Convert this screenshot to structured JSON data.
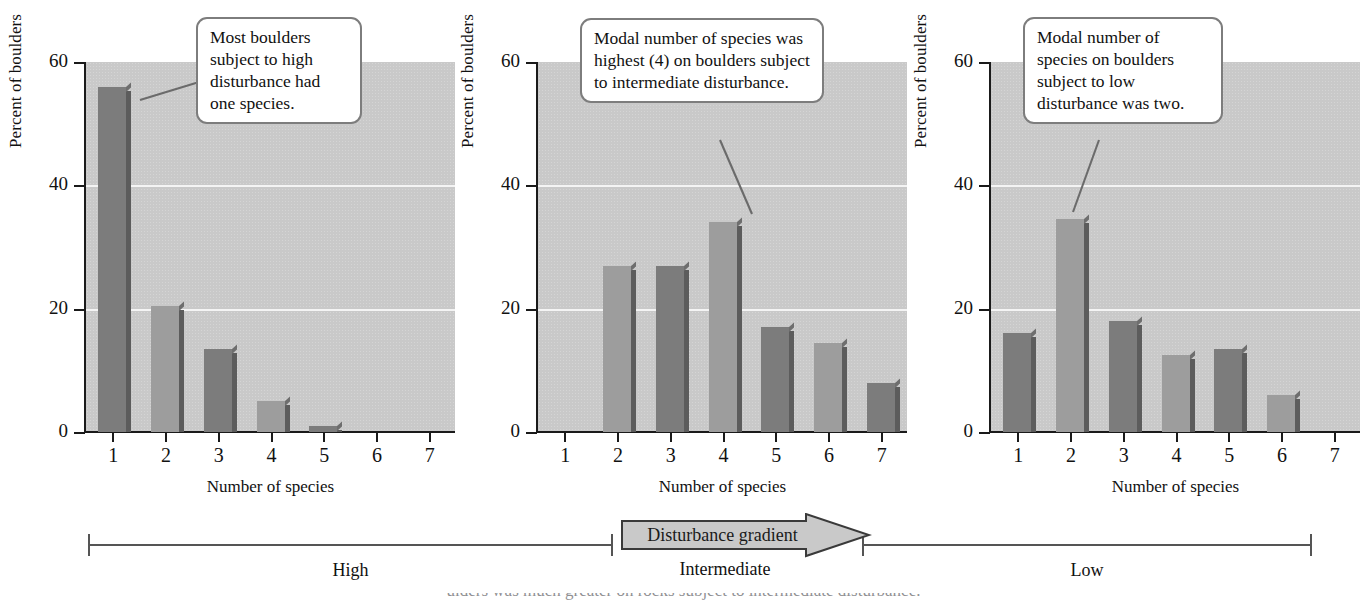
{
  "figure": {
    "axis_y_title": "Percent of boulders",
    "axis_x_title": "Number of species",
    "y_ticks": [
      "0",
      "20",
      "40",
      "60"
    ],
    "x_ticks": [
      "1",
      "2",
      "3",
      "4",
      "5",
      "6",
      "7"
    ],
    "caption_sliver": "ulders was much greater on rocks subject to intermediate disturbance."
  },
  "colors": {
    "plot_background": "#c9c9c9",
    "gridline": "#f4f4f4",
    "bar_dark": "#7c7c7c",
    "bar_light": "#9d9d9d",
    "bar_side": "#5c5c5c",
    "axis": "#1a1a1a",
    "callout_border": "#7d7d7d",
    "leader": "#6b6b6b"
  },
  "panels": [
    {
      "id": "high-disturbance",
      "callout": "Most boulders subject to high disturbance had one species.",
      "chart_data": {
        "type": "bar",
        "title": "",
        "xlabel": "Number of species",
        "ylabel": "Percent of boulders",
        "categories": [
          "1",
          "2",
          "3",
          "4",
          "5",
          "6",
          "7"
        ],
        "values": [
          56,
          20.5,
          13.5,
          5,
          1,
          0,
          0
        ],
        "ylim": [
          0,
          60
        ],
        "yticks": [
          0,
          20,
          40,
          60
        ],
        "grid": "horizontal-at-20-and-40",
        "legend": "none"
      }
    },
    {
      "id": "intermediate-disturbance",
      "callout": "Modal number of species was highest (4) on boulders subject to intermediate disturbance.",
      "chart_data": {
        "type": "bar",
        "title": "",
        "xlabel": "Number of species",
        "ylabel": "Percent of boulders",
        "categories": [
          "1",
          "2",
          "3",
          "4",
          "5",
          "6",
          "7"
        ],
        "values": [
          0,
          27,
          27,
          34,
          17,
          14.5,
          8
        ],
        "ylim": [
          0,
          60
        ],
        "yticks": [
          0,
          20,
          40,
          60
        ],
        "grid": "horizontal-at-20-and-40",
        "legend": "none"
      }
    },
    {
      "id": "low-disturbance",
      "callout": "Modal number of species on boulders subject to low disturbance was two.",
      "chart_data": {
        "type": "bar",
        "title": "",
        "xlabel": "Number of species",
        "ylabel": "Percent of boulders",
        "categories": [
          "1",
          "2",
          "3",
          "4",
          "5",
          "6",
          "7"
        ],
        "values": [
          16,
          34.5,
          18,
          12.5,
          13.5,
          6,
          0
        ],
        "ylim": [
          0,
          60
        ],
        "yticks": [
          0,
          20,
          40,
          60
        ],
        "grid": "horizontal-at-20-and-40",
        "legend": "none"
      }
    }
  ],
  "gradient": {
    "arrow_label": "Disturbance gradient",
    "ranges": [
      {
        "label": "High"
      },
      {
        "label": "Intermediate"
      },
      {
        "label": "Low"
      }
    ]
  }
}
